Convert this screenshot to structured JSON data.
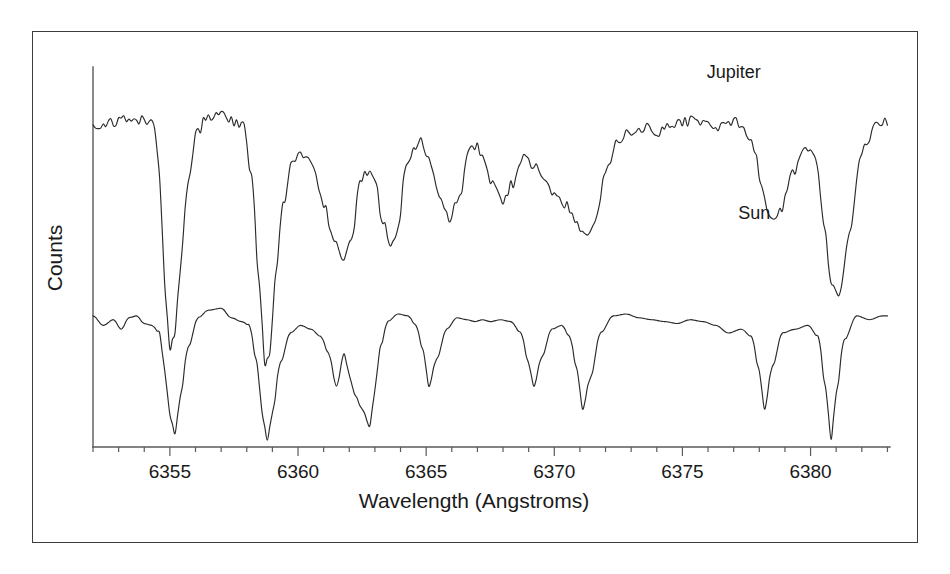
{
  "chart_data": {
    "type": "line",
    "title": "",
    "xlabel": "Wavelength (Angstroms)",
    "ylabel": "Counts",
    "xlim": [
      6352.0,
      6383.1
    ],
    "ylim": [
      0,
      1.0
    ],
    "grid": false,
    "legend_position": "inline-right-of-trace",
    "xtick_labels": [
      "6355",
      "6360",
      "6365",
      "6370",
      "6375",
      "6380"
    ],
    "xtick_values": [
      6355,
      6360,
      6365,
      6370,
      6375,
      6380
    ],
    "xminor_step": 1,
    "ytick_labels": [],
    "annotations": [
      {
        "text": "Jupiter",
        "x": 6377.0,
        "y": 0.97
      },
      {
        "text": "Sun",
        "x": 6377.8,
        "y": 0.6
      }
    ],
    "series": [
      {
        "name": "Jupiter",
        "label": "Jupiter",
        "color": "#2b2b2b",
        "continuum": 0.855,
        "noisy": true,
        "x": [
          6352.0,
          6352.3,
          6352.6,
          6352.9,
          6353.2,
          6353.5,
          6353.8,
          6354.1,
          6354.4,
          6354.6,
          6354.8,
          6355.0,
          6355.2,
          6355.4,
          6355.7,
          6356.0,
          6356.4,
          6356.8,
          6357.2,
          6357.6,
          6357.9,
          6358.2,
          6358.5,
          6358.7,
          6358.9,
          6359.1,
          6359.4,
          6359.8,
          6360.2,
          6360.6,
          6361.0,
          6361.4,
          6361.8,
          6362.1,
          6362.4,
          6362.7,
          6363.0,
          6363.3,
          6363.6,
          6363.9,
          6364.2,
          6364.5,
          6364.8,
          6365.1,
          6365.5,
          6365.9,
          6366.3,
          6366.7,
          6367.0,
          6367.3,
          6367.6,
          6368.0,
          6368.4,
          6368.8,
          6369.2,
          6369.6,
          6370.0,
          6370.4,
          6370.8,
          6371.2,
          6371.6,
          6372.0,
          6372.5,
          6373.0,
          6373.5,
          6374.0,
          6374.5,
          6375.0,
          6375.5,
          6376.0,
          6376.5,
          6377.0,
          6377.4,
          6377.8,
          6378.1,
          6378.4,
          6378.8,
          6379.3,
          6379.8,
          6380.2,
          6380.5,
          6380.8,
          6381.1,
          6381.5,
          6382.0,
          6382.5,
          6383.0
        ],
        "y": [
          0.855,
          0.845,
          0.86,
          0.85,
          0.862,
          0.848,
          0.858,
          0.855,
          0.845,
          0.7,
          0.43,
          0.255,
          0.3,
          0.47,
          0.69,
          0.82,
          0.86,
          0.88,
          0.87,
          0.855,
          0.84,
          0.7,
          0.42,
          0.215,
          0.25,
          0.43,
          0.64,
          0.755,
          0.77,
          0.735,
          0.64,
          0.545,
          0.49,
          0.555,
          0.69,
          0.725,
          0.7,
          0.6,
          0.52,
          0.57,
          0.73,
          0.79,
          0.8,
          0.76,
          0.66,
          0.6,
          0.665,
          0.78,
          0.79,
          0.75,
          0.69,
          0.65,
          0.695,
          0.76,
          0.74,
          0.7,
          0.66,
          0.64,
          0.6,
          0.555,
          0.59,
          0.72,
          0.81,
          0.83,
          0.84,
          0.83,
          0.845,
          0.855,
          0.86,
          0.85,
          0.845,
          0.855,
          0.84,
          0.79,
          0.69,
          0.6,
          0.62,
          0.72,
          0.79,
          0.76,
          0.6,
          0.43,
          0.39,
          0.56,
          0.78,
          0.84,
          0.855
        ]
      },
      {
        "name": "Sun",
        "label": "Sun",
        "color": "#2b2b2b",
        "continuum": 0.345,
        "noisy": false,
        "x": [
          6352.0,
          6352.4,
          6352.8,
          6353.1,
          6353.4,
          6353.7,
          6354.0,
          6354.3,
          6354.6,
          6354.8,
          6355.0,
          6355.2,
          6355.4,
          6355.7,
          6356.1,
          6356.5,
          6357.0,
          6357.4,
          6357.8,
          6358.1,
          6358.4,
          6358.6,
          6358.8,
          6359.0,
          6359.3,
          6359.7,
          6360.1,
          6360.5,
          6360.9,
          6361.2,
          6361.5,
          6361.8,
          6362.0,
          6362.2,
          6362.5,
          6362.8,
          6363.0,
          6363.2,
          6363.5,
          6363.9,
          6364.3,
          6364.6,
          6364.9,
          6365.1,
          6365.4,
          6365.8,
          6366.2,
          6366.6,
          6366.9,
          6367.2,
          6367.5,
          6367.9,
          6368.3,
          6368.7,
          6369.0,
          6369.2,
          6369.5,
          6369.9,
          6370.3,
          6370.6,
          6370.9,
          6371.1,
          6371.4,
          6371.8,
          6372.3,
          6372.8,
          6373.3,
          6373.8,
          6374.3,
          6374.8,
          6375.3,
          6375.8,
          6376.3,
          6376.8,
          6377.3,
          6377.7,
          6378.0,
          6378.2,
          6378.5,
          6378.9,
          6379.4,
          6379.9,
          6380.3,
          6380.6,
          6380.8,
          6381.0,
          6381.3,
          6381.8,
          6382.3,
          6382.8,
          6383.0
        ],
        "y": [
          0.345,
          0.32,
          0.335,
          0.31,
          0.34,
          0.345,
          0.325,
          0.32,
          0.3,
          0.2,
          0.085,
          0.035,
          0.13,
          0.26,
          0.34,
          0.36,
          0.365,
          0.34,
          0.33,
          0.32,
          0.22,
          0.09,
          0.018,
          0.09,
          0.22,
          0.3,
          0.32,
          0.31,
          0.29,
          0.245,
          0.16,
          0.245,
          0.19,
          0.14,
          0.1,
          0.055,
          0.15,
          0.26,
          0.33,
          0.35,
          0.345,
          0.32,
          0.25,
          0.16,
          0.23,
          0.31,
          0.34,
          0.335,
          0.33,
          0.335,
          0.33,
          0.335,
          0.33,
          0.3,
          0.22,
          0.16,
          0.235,
          0.31,
          0.32,
          0.29,
          0.2,
          0.1,
          0.18,
          0.3,
          0.345,
          0.35,
          0.34,
          0.335,
          0.33,
          0.325,
          0.335,
          0.33,
          0.32,
          0.3,
          0.31,
          0.29,
          0.2,
          0.1,
          0.21,
          0.3,
          0.31,
          0.32,
          0.29,
          0.15,
          0.02,
          0.14,
          0.28,
          0.345,
          0.335,
          0.345,
          0.345
        ]
      }
    ]
  },
  "axes": {
    "x_axis_name": "wavelength-axis",
    "y_axis_name": "counts-axis"
  }
}
